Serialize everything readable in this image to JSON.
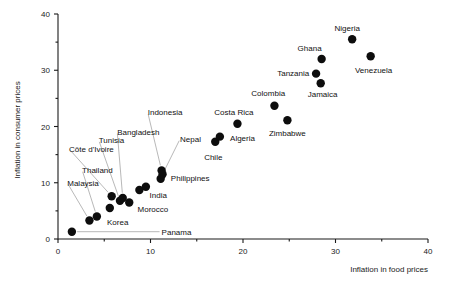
{
  "chart_data": {
    "type": "scatter",
    "title": "",
    "xlabel": "Inflation in food prices",
    "ylabel": "Inflation in consumer prices",
    "xlim": [
      0,
      40
    ],
    "ylim": [
      0,
      40
    ],
    "xticks": [
      0,
      10,
      20,
      30,
      40
    ],
    "yticks": [
      0,
      10,
      20,
      30,
      40
    ],
    "xtick_labels": [
      "0",
      "10",
      "20",
      "30",
      "40"
    ],
    "ytick_labels": [
      "0",
      "10",
      "20",
      "30",
      "40"
    ],
    "grid": false,
    "legend": null,
    "points": [
      {
        "name": "Panama",
        "x": 1.5,
        "y": 1.3,
        "label_x": 11.2,
        "label_y": 1.3,
        "anchor": "start",
        "leader": true
      },
      {
        "name": "Malaysia",
        "x": 3.4,
        "y": 3.3,
        "label_x": 1.0,
        "label_y": 10.0,
        "anchor": "start",
        "leader": true
      },
      {
        "name": "Thailand",
        "x": 4.2,
        "y": 4.0,
        "label_x": 2.6,
        "label_y": 12.3,
        "anchor": "start",
        "leader": true
      },
      {
        "name": "Korea",
        "x": 5.6,
        "y": 5.5,
        "label_x": 5.3,
        "label_y": 3.1,
        "anchor": "start",
        "leader": false
      },
      {
        "name": "Côte d'Ivoire",
        "x": 5.8,
        "y": 7.6,
        "label_x": 1.2,
        "label_y": 16.0,
        "anchor": "start",
        "leader": true
      },
      {
        "name": "Tunisia",
        "x": 6.7,
        "y": 6.8,
        "label_x": 4.4,
        "label_y": 17.6,
        "anchor": "start",
        "leader": true
      },
      {
        "name": "Bangladesh",
        "x": 7.0,
        "y": 7.3,
        "label_x": 6.4,
        "label_y": 19.1,
        "anchor": "start",
        "leader": true
      },
      {
        "name": "Morocco",
        "x": 7.7,
        "y": 6.5,
        "label_x": 8.6,
        "label_y": 5.4,
        "anchor": "start",
        "leader": false
      },
      {
        "name": "India",
        "x": 8.8,
        "y": 8.7,
        "label_x": 9.9,
        "label_y": 7.9,
        "anchor": "start",
        "leader": false
      },
      {
        "name": "India2",
        "x": 9.5,
        "y": 9.3,
        "label_x": null,
        "label_y": null,
        "anchor": "start",
        "leader": false
      },
      {
        "name": "Indonesia",
        "x": 11.2,
        "y": 12.2,
        "label_x": 9.7,
        "label_y": 22.5,
        "anchor": "start",
        "leader": true
      },
      {
        "name": "Philippines",
        "x": 11.1,
        "y": 10.7,
        "label_x": 12.2,
        "label_y": 10.8,
        "anchor": "start",
        "leader": false
      },
      {
        "name": "Nepal",
        "x": 11.3,
        "y": 11.5,
        "label_x": 13.2,
        "label_y": 17.8,
        "anchor": "start",
        "leader": true
      },
      {
        "name": "Chile",
        "x": 17.0,
        "y": 17.3,
        "label_x": 15.8,
        "label_y": 14.6,
        "anchor": "start",
        "leader": false
      },
      {
        "name": "Algeria",
        "x": 17.5,
        "y": 18.2,
        "label_x": 18.6,
        "label_y": 18.0,
        "anchor": "start",
        "leader": false
      },
      {
        "name": "Costa Rica",
        "x": 19.4,
        "y": 20.5,
        "label_x": 16.9,
        "label_y": 22.6,
        "anchor": "start",
        "leader": false
      },
      {
        "name": "Colombia",
        "x": 23.4,
        "y": 23.7,
        "label_x": 20.9,
        "label_y": 25.9,
        "anchor": "start",
        "leader": false
      },
      {
        "name": "Zimbabwe",
        "x": 24.8,
        "y": 21.1,
        "label_x": 22.8,
        "label_y": 18.9,
        "anchor": "start",
        "leader": false
      },
      {
        "name": "Tanzania",
        "x": 27.9,
        "y": 29.4,
        "label_x": 23.7,
        "label_y": 29.5,
        "anchor": "start",
        "leader": false
      },
      {
        "name": "Jamaica",
        "x": 28.4,
        "y": 27.7,
        "label_x": 27.0,
        "label_y": 25.8,
        "anchor": "start",
        "leader": false
      },
      {
        "name": "Ghana",
        "x": 28.5,
        "y": 32.0,
        "label_x": 25.9,
        "label_y": 33.9,
        "anchor": "start",
        "leader": false
      },
      {
        "name": "Nigeria",
        "x": 31.8,
        "y": 35.5,
        "label_x": 29.9,
        "label_y": 37.5,
        "anchor": "start",
        "leader": false
      },
      {
        "name": "Venezuela",
        "x": 33.8,
        "y": 32.5,
        "label_x": 32.1,
        "label_y": 30.1,
        "anchor": "start",
        "leader": false
      }
    ]
  }
}
